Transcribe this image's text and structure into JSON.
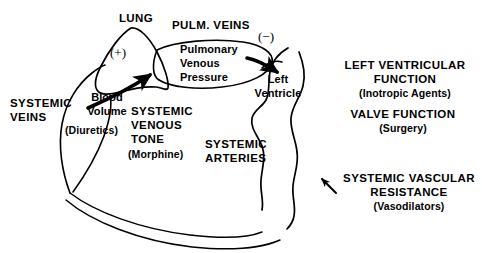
{
  "diagram": {
    "type": "physiology-flow-diagram",
    "ink_color": "#000000",
    "background_color": "#ffffff",
    "labels": {
      "lung": "LUNG",
      "pulm_veins": "PULM. VEINS",
      "pulmonary_venous_pressure_line1": "Pulmonary",
      "pulmonary_venous_pressure_line2": "Venous",
      "pulmonary_venous_pressure_line3": "Pressure",
      "left_ventricle_line1": "Left",
      "left_ventricle_line2": "Ventricle",
      "systemic_veins_line1": "SYSTEMIC",
      "systemic_veins_line2": "VEINS",
      "blood_volume_line1": "Blood",
      "blood_volume_line2": "Volume",
      "diuretics": "(Diuretics)",
      "systemic_venous_tone_line1": "SYSTEMIC",
      "systemic_venous_tone_line2": "VENOUS",
      "systemic_venous_tone_line3": "TONE",
      "morphine": "(Morphine)",
      "systemic_arteries_line1": "SYSTEMIC",
      "systemic_arteries_line2": "ARTERIES",
      "lv_function_line1": "LEFT VENTRICULAR",
      "lv_function_line2": "FUNCTION",
      "inotropic_agents": "(Inotropic Agents)",
      "valve_function": "VALVE FUNCTION",
      "surgery": "(Surgery)",
      "svr_line1": "SYSTEMIC VASCULAR",
      "svr_line2": "RESISTANCE",
      "vasodilators": "(Vasodilators)",
      "plus_sign": "(+)",
      "minus_sign": "(−)"
    },
    "nodes": [
      {
        "id": "lung",
        "label": "LUNG",
        "shape": "teardrop"
      },
      {
        "id": "pulmonary-veins",
        "label": "PULM. VEINS",
        "shape": "ellipse"
      },
      {
        "id": "left-ventricle",
        "label": "Left Ventricle",
        "shape": "chamber"
      },
      {
        "id": "systemic-arteries",
        "label": "SYSTEMIC ARTERIES",
        "shape": "vessel"
      },
      {
        "id": "systemic-veins",
        "label": "SYSTEMIC VEINS",
        "shape": "vessel"
      }
    ],
    "arrows": [
      {
        "id": "blood-volume-to-lung",
        "sign": "(+)",
        "direction": "up-right"
      },
      {
        "id": "pulmonary-to-left-ventricle",
        "sign": "(−)",
        "direction": "right"
      },
      {
        "id": "svr-pointer",
        "direction": "up-left"
      }
    ]
  }
}
